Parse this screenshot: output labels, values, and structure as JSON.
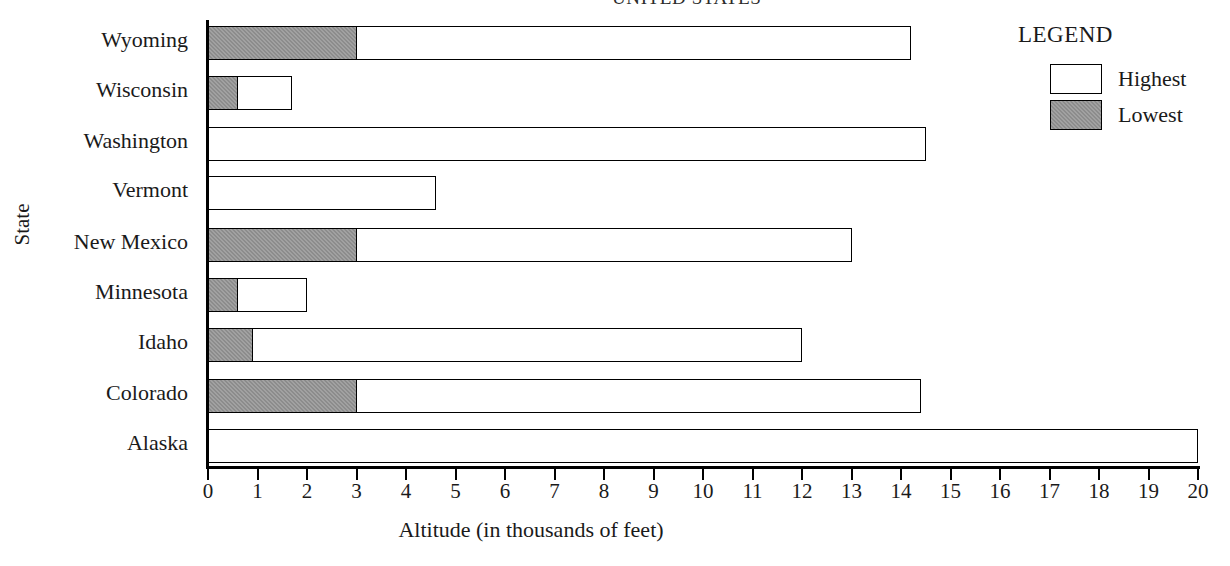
{
  "chart_data": {
    "type": "bar",
    "orientation": "horizontal",
    "stacked": false,
    "title": "UNITED STATES",
    "xlabel": "Altitude (in thousands of feet)",
    "ylabel": "State",
    "xlim": [
      0,
      20
    ],
    "xticks": [
      0,
      1,
      2,
      3,
      4,
      5,
      6,
      7,
      8,
      9,
      10,
      11,
      12,
      13,
      14,
      15,
      16,
      17,
      18,
      19,
      20
    ],
    "xticklabels": [
      "0",
      "1",
      "2",
      "3",
      "4",
      "5",
      "6",
      "7",
      "8",
      "9",
      "10",
      "11",
      "12",
      "13",
      "14",
      "15",
      "16",
      "17",
      "18",
      "19",
      "20"
    ],
    "grid": false,
    "categories": [
      "Wyoming",
      "Wisconsin",
      "Washington",
      "Vermont",
      "New Mexico",
      "Minnesota",
      "Idaho",
      "Colorado",
      "Alaska"
    ],
    "series": [
      {
        "name": "Highest",
        "color": "#ffffff",
        "values": [
          14.2,
          1.7,
          14.5,
          4.6,
          13.0,
          2.0,
          12.0,
          14.4,
          20.0
        ]
      },
      {
        "name": "Lowest",
        "color": "#8c8c8c",
        "values": [
          3.0,
          0.6,
          0.0,
          0.0,
          3.0,
          0.6,
          0.9,
          3.0,
          0.0
        ]
      }
    ],
    "legend": {
      "title": "LEGEND",
      "position": "top-right",
      "entries": [
        {
          "label": "Highest",
          "swatch": "white"
        },
        {
          "label": "Lowest",
          "swatch": "gray"
        }
      ]
    }
  },
  "colors": {
    "lowest_fill": "#8c8c8c",
    "highest_fill": "#ffffff",
    "outline": "#000000",
    "text": "#1a1a1a",
    "background": "#ffffff"
  }
}
